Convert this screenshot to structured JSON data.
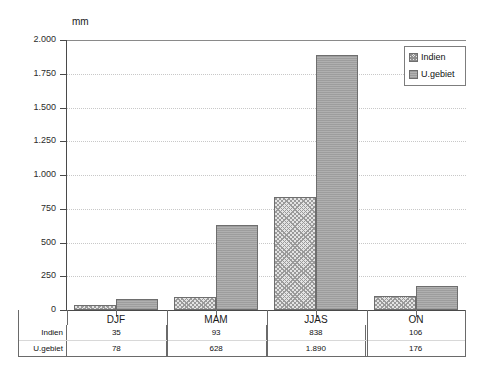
{
  "chart_data": {
    "type": "bar",
    "title": "",
    "xlabel": "",
    "ylabel": "mm",
    "unit_label": "mm",
    "categories": [
      "DJF",
      "MAM",
      "JJAS",
      "ON"
    ],
    "series": [
      {
        "name": "Indien",
        "values": [
          35,
          93,
          838,
          106
        ],
        "labels": [
          "35",
          "93",
          "838",
          "106"
        ]
      },
      {
        "name": "U.gebiet",
        "values": [
          78,
          628,
          1890,
          176
        ],
        "labels": [
          "78",
          "628",
          "1.890",
          "176"
        ]
      }
    ],
    "ylim": [
      0,
      2000
    ],
    "yticks": [
      0,
      250,
      500,
      750,
      1000,
      1250,
      1500,
      1750,
      2000
    ],
    "ytick_labels": [
      "0",
      "250",
      "500",
      "750",
      "1.000",
      "1.250",
      "1.500",
      "1.750",
      "2.000"
    ],
    "grid": true,
    "legend_position": "top-right",
    "colors": {
      "indien": "#e4e4e4",
      "ugebiet": "#a8a8a8",
      "axis": "#4a4a4a",
      "grid": "#c8c8c8"
    }
  },
  "legend": {
    "items": [
      {
        "label": "Indien"
      },
      {
        "label": "U.gebiet"
      }
    ]
  },
  "table": {
    "row_headers": [
      "Indien",
      "U.gebiet"
    ],
    "columns": [
      "DJF",
      "MAM",
      "JJAS",
      "ON"
    ],
    "rows": [
      [
        "35",
        "93",
        "838",
        "106"
      ],
      [
        "78",
        "628",
        "1.890",
        "176"
      ]
    ]
  }
}
